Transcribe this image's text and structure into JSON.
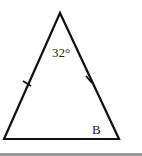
{
  "diagram": {
    "type": "isosceles-triangle",
    "apex_angle_label": "32°",
    "base_angle_label": "B",
    "tick_marks": 2,
    "stroke_color": "#111111",
    "bottom_rule_color": "#9a9a9a"
  }
}
